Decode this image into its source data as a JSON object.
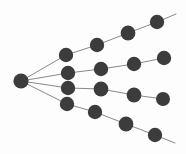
{
  "diagram": {
    "type": "node-link-tree",
    "width": 186,
    "height": 154,
    "background_color": "#fdfdfd",
    "node_color": "#3c3c3c",
    "edge_color": "#7a7a7a",
    "node_radius": 7.2,
    "edge_width": 0.9,
    "root_label": "root",
    "branch_count": 4,
    "nodes_per_branch": 4,
    "total_nodes": 17,
    "nodes": [
      {
        "id": "root",
        "name": "root-node",
        "x": 21,
        "y": 81,
        "r": 7.6
      },
      {
        "id": "b1n1",
        "name": "branch1-node1",
        "x": 66,
        "y": 55,
        "r": 7.2
      },
      {
        "id": "b1n2",
        "name": "branch1-node2",
        "x": 97,
        "y": 45,
        "r": 7.2
      },
      {
        "id": "b1n3",
        "name": "branch1-node3",
        "x": 128,
        "y": 33,
        "r": 7.4
      },
      {
        "id": "b1n4",
        "name": "branch1-node4",
        "x": 157,
        "y": 22,
        "r": 7.2
      },
      {
        "id": "b2n1",
        "name": "branch2-node1",
        "x": 68,
        "y": 73,
        "r": 7.2
      },
      {
        "id": "b2n2",
        "name": "branch2-node2",
        "x": 101,
        "y": 69,
        "r": 7.2
      },
      {
        "id": "b2n3",
        "name": "branch2-node3",
        "x": 134,
        "y": 64,
        "r": 7.2
      },
      {
        "id": "b2n4",
        "name": "branch2-node4",
        "x": 164,
        "y": 58,
        "r": 7.2
      },
      {
        "id": "b3n1",
        "name": "branch3-node1",
        "x": 68,
        "y": 88,
        "r": 7.2
      },
      {
        "id": "b3n2",
        "name": "branch3-node2",
        "x": 101,
        "y": 89,
        "r": 7.4
      },
      {
        "id": "b3n3",
        "name": "branch3-node3",
        "x": 134,
        "y": 95,
        "r": 7.4
      },
      {
        "id": "b3n4",
        "name": "branch3-node4",
        "x": 163,
        "y": 99,
        "r": 7.0
      },
      {
        "id": "b4n1",
        "name": "branch4-node1",
        "x": 67,
        "y": 104,
        "r": 7.2
      },
      {
        "id": "b4n2",
        "name": "branch4-node2",
        "x": 95,
        "y": 112,
        "r": 7.2
      },
      {
        "id": "b4n3",
        "name": "branch4-node3",
        "x": 126,
        "y": 124,
        "r": 7.4
      },
      {
        "id": "b4n4",
        "name": "branch4-node4",
        "x": 155,
        "y": 135,
        "r": 7.2
      }
    ],
    "edges": [
      {
        "name": "edge-root-b1n1",
        "x1": 21,
        "y1": 81,
        "x2": 66,
        "y2": 55
      },
      {
        "name": "edge-root-b2n1",
        "x1": 21,
        "y1": 81,
        "x2": 68,
        "y2": 73
      },
      {
        "name": "edge-root-b3n1",
        "x1": 21,
        "y1": 81,
        "x2": 68,
        "y2": 88
      },
      {
        "name": "edge-root-b4n1",
        "x1": 21,
        "y1": 81,
        "x2": 67,
        "y2": 104
      },
      {
        "name": "edge-b1n1-b1n2",
        "x1": 66,
        "y1": 55,
        "x2": 97,
        "y2": 45
      },
      {
        "name": "edge-b1n2-b1n3",
        "x1": 97,
        "y1": 45,
        "x2": 128,
        "y2": 33
      },
      {
        "name": "edge-b1n3-b1n4",
        "x1": 128,
        "y1": 33,
        "x2": 157,
        "y2": 22
      },
      {
        "name": "edge-b1n4-tail",
        "x1": 157,
        "y1": 22,
        "x2": 176,
        "y2": 14
      },
      {
        "name": "edge-b2n1-b2n2",
        "x1": 68,
        "y1": 73,
        "x2": 101,
        "y2": 69
      },
      {
        "name": "edge-b2n2-b2n3",
        "x1": 101,
        "y1": 69,
        "x2": 134,
        "y2": 64
      },
      {
        "name": "edge-b2n3-b2n4",
        "x1": 134,
        "y1": 64,
        "x2": 164,
        "y2": 58
      },
      {
        "name": "edge-b3n1-b3n2",
        "x1": 68,
        "y1": 88,
        "x2": 101,
        "y2": 89
      },
      {
        "name": "edge-b3n2-b3n3",
        "x1": 101,
        "y1": 89,
        "x2": 134,
        "y2": 95
      },
      {
        "name": "edge-b3n3-b3n4",
        "x1": 134,
        "y1": 95,
        "x2": 163,
        "y2": 99
      },
      {
        "name": "edge-b4n1-b4n2",
        "x1": 67,
        "y1": 104,
        "x2": 95,
        "y2": 112
      },
      {
        "name": "edge-b4n2-b4n3",
        "x1": 95,
        "y1": 112,
        "x2": 126,
        "y2": 124
      },
      {
        "name": "edge-b4n3-b4n4",
        "x1": 126,
        "y1": 124,
        "x2": 155,
        "y2": 135
      },
      {
        "name": "edge-b4n4-tail",
        "x1": 155,
        "y1": 135,
        "x2": 175,
        "y2": 143
      }
    ]
  }
}
